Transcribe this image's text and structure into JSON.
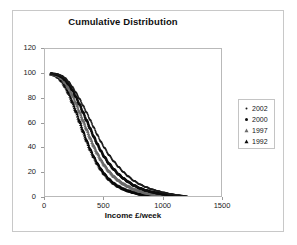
{
  "chart_data": {
    "type": "scatter",
    "title": "Cumulative Distribution",
    "xlabel": "Income £/week",
    "ylabel": "",
    "xlim": [
      0,
      1500
    ],
    "ylim": [
      0,
      120
    ],
    "xticks": [
      "0",
      "500",
      "1000",
      "1500"
    ],
    "xtick_values": [
      0,
      500,
      1000,
      1500
    ],
    "yticks": [
      "0",
      "20",
      "40",
      "60",
      "80",
      "100",
      "120"
    ],
    "ytick_values": [
      0,
      20,
      40,
      60,
      80,
      100,
      120
    ],
    "grid": false,
    "legend_position": "right",
    "x": [
      50,
      80,
      110,
      140,
      170,
      200,
      230,
      260,
      290,
      320,
      350,
      380,
      410,
      440,
      470,
      500,
      540,
      580,
      620,
      660,
      700,
      750,
      800,
      850,
      900,
      950,
      1000,
      1060,
      1120,
      1200
    ],
    "series": [
      {
        "name": "2002",
        "marker": "small-dot",
        "color": "#1a1a1a",
        "values": [
          100,
          100,
          99.5,
          98.5,
          96.5,
          93.5,
          89.5,
          85,
          80,
          74.5,
          69,
          63,
          57,
          51,
          45.5,
          40.5,
          34.5,
          29.5,
          25,
          21,
          17.5,
          13.8,
          11,
          8.8,
          7,
          5.6,
          4.4,
          3.2,
          2.2,
          1.2
        ]
      },
      {
        "name": "2000",
        "marker": "dot",
        "color": "#0d0d0d",
        "values": [
          100,
          99.8,
          99,
          97.5,
          95,
          91.5,
          87,
          81.5,
          75.5,
          69,
          62.5,
          56,
          49.5,
          43.5,
          38,
          33,
          27.5,
          23,
          19,
          15.8,
          13,
          10,
          7.8,
          6.1,
          4.8,
          3.8,
          3,
          2.2,
          1.5,
          0.8
        ]
      },
      {
        "name": "1997",
        "marker": "triangle-light",
        "color": "#6a6a6a",
        "values": [
          100,
          99.5,
          98.5,
          96.5,
          93,
          88.5,
          83,
          76.5,
          69.5,
          62.5,
          55.5,
          48.5,
          42,
          36.2,
          31,
          26.5,
          21.5,
          17.5,
          14.2,
          11.5,
          9.4,
          7.1,
          5.5,
          4.2,
          3.3,
          2.6,
          2,
          1.5,
          1,
          0.5
        ]
      },
      {
        "name": "1992",
        "marker": "triangle-dark",
        "color": "#0a0a0a",
        "values": [
          100,
          99.2,
          97.5,
          94.5,
          90,
          84.5,
          77.5,
          70,
          62,
          54,
          46.5,
          39.5,
          33.5,
          28,
          23.5,
          19.5,
          15.2,
          11.9,
          9.4,
          7.4,
          5.9,
          4.4,
          3.3,
          2.5,
          1.9,
          1.5,
          1.2,
          0.9,
          0.6,
          0.3
        ]
      }
    ]
  },
  "legend": {
    "items": [
      {
        "label": "2002",
        "marker": "small-dot"
      },
      {
        "label": "2000",
        "marker": "dot"
      },
      {
        "label": "1997",
        "marker": "triangle-light"
      },
      {
        "label": "1992",
        "marker": "triangle-dark"
      }
    ]
  }
}
